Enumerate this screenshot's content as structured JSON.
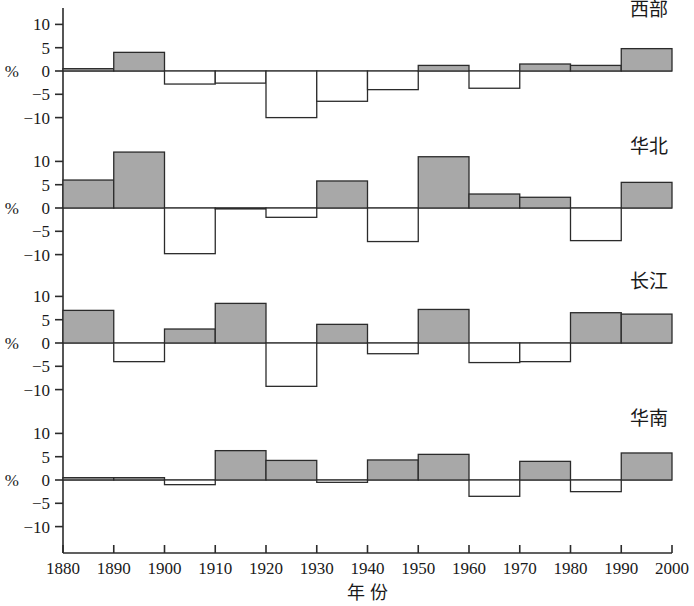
{
  "chart_data": {
    "type": "bar",
    "title": "",
    "xlabel": "年      份",
    "ylabel": "%",
    "xlim": [
      1880,
      2000
    ],
    "ylim": [
      -13,
      13
    ],
    "yticks": [
      10,
      5,
      0,
      -5,
      -10
    ],
    "ytick_labels": [
      "10",
      "5",
      "0",
      "−5",
      "−10"
    ],
    "xticks": [
      1880,
      1890,
      1900,
      1910,
      1920,
      1930,
      1940,
      1950,
      1960,
      1970,
      1980,
      1990,
      2000
    ],
    "xtick_labels": [
      "1880",
      "1890",
      "1900",
      "1910",
      "1920",
      "1930",
      "1940",
      "1950",
      "1960",
      "1970",
      "1980",
      "1990",
      "2000"
    ],
    "grid": false,
    "legend": "none",
    "bin_starts": [
      1880,
      1890,
      1900,
      1910,
      1920,
      1930,
      1940,
      1950,
      1960,
      1970,
      1980,
      1990
    ],
    "bin_width": 10,
    "positive_fill": "#a8a8a8",
    "negative_fill": "#ffffff",
    "stroke": "#2b2b2b",
    "panels": [
      {
        "name": "西部",
        "label": "西部",
        "ylabel": "%",
        "categories": [
          "1880-1890",
          "1890-1900",
          "1900-1910",
          "1910-1920",
          "1920-1930",
          "1930-1940",
          "1940-1950",
          "1950-1960",
          "1960-1970",
          "1970-1980",
          "1980-1990",
          "1990-2000"
        ],
        "values": [
          0.5,
          4.0,
          -2.8,
          -2.6,
          -10.0,
          -6.5,
          -4.0,
          1.2,
          -3.7,
          1.5,
          1.2,
          4.8
        ]
      },
      {
        "name": "华北",
        "label": "华北",
        "ylabel": "%",
        "categories": [
          "1880-1890",
          "1890-1900",
          "1900-1910",
          "1910-1920",
          "1920-1930",
          "1930-1940",
          "1940-1950",
          "1950-1960",
          "1960-1970",
          "1970-1980",
          "1980-1990",
          "1990-2000"
        ],
        "values": [
          6.0,
          12.0,
          -9.8,
          -0.2,
          -2.0,
          5.8,
          -7.2,
          11.0,
          3.0,
          2.3,
          -7.0,
          5.5
        ]
      },
      {
        "name": "长江",
        "label": "长江",
        "ylabel": "%",
        "categories": [
          "1880-1890",
          "1890-1900",
          "1900-1910",
          "1910-1920",
          "1920-1930",
          "1930-1940",
          "1940-1950",
          "1950-1960",
          "1960-1970",
          "1970-1980",
          "1980-1990",
          "1990-2000"
        ],
        "values": [
          7.0,
          -4.0,
          3.0,
          8.5,
          -9.3,
          4.0,
          -2.3,
          7.2,
          -4.2,
          -4.0,
          6.5,
          6.2
        ]
      },
      {
        "name": "华南",
        "label": "华南",
        "ylabel": "%",
        "categories": [
          "1880-1890",
          "1890-1900",
          "1900-1910",
          "1910-1920",
          "1920-1930",
          "1930-1940",
          "1940-1950",
          "1950-1960",
          "1960-1970",
          "1970-1980",
          "1980-1990",
          "1990-2000"
        ],
        "values": [
          0.5,
          0.5,
          -1.0,
          6.3,
          4.2,
          -0.5,
          4.3,
          5.5,
          -3.5,
          4.0,
          -2.5,
          5.8
        ]
      }
    ]
  }
}
